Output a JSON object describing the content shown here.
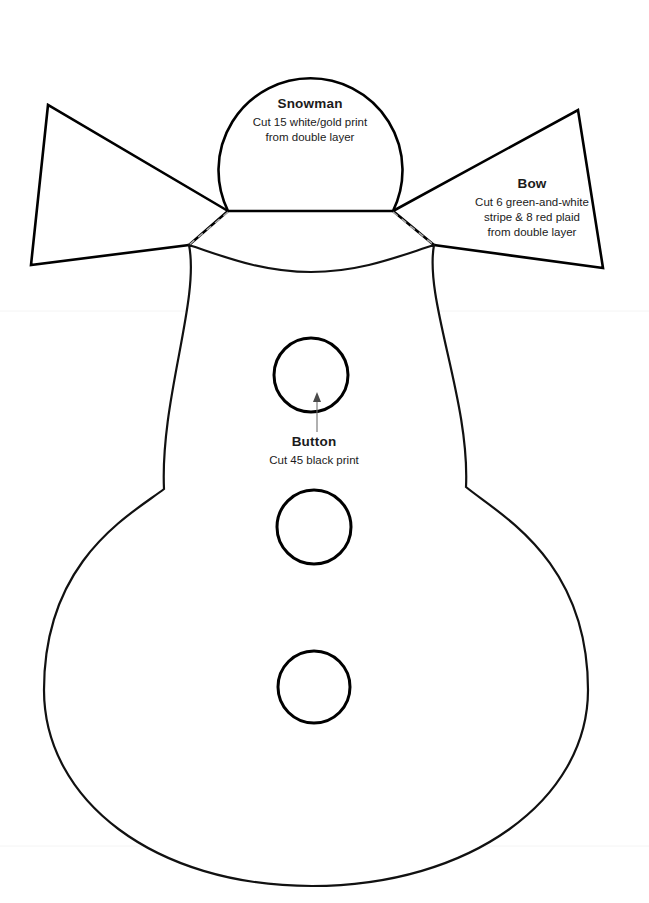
{
  "document": {
    "kind": "sewing-pattern-template",
    "background_color": "#ffffff",
    "line_color": "#000000",
    "fold_line_color": "#a8a8a8",
    "width": 649,
    "height": 903
  },
  "pieces": {
    "snowman": {
      "title": "Snowman",
      "instructions": [
        "Cut 15 white/gold print",
        "from double layer"
      ]
    },
    "bow": {
      "title": "Bow",
      "instructions": [
        "Cut 6 green-and-white",
        "stripe & 8 red plaid",
        "from double layer"
      ]
    },
    "button": {
      "title": "Button",
      "instructions": [
        "Cut 45 black print"
      ]
    }
  },
  "shapes": {
    "head_path": "M 228 211 A 92 92 0 1 1 393 211 Z",
    "body_path": "M 189 245 C 220 255 260 272 311 272 C 362 272 402 255 434 245 C 424 300 470 400 466 487 C 500 515 588 560 588 690 C 588 800 470 886 312 886 C 154 886 44 800 44 690 C 44 560 130 515 164 489 C 160 400 200 300 189 245 Z",
    "bow_left_path": "M 228 211 L 48 105 L 31 265 L 189 245 Z",
    "bow_right_path": "M 393 211 L 578 110 L 603 268 L 434 245 Z",
    "fold_left_path": "M 228 212 L 189 245",
    "fold_right_path": "M 393 212 L 434 245",
    "buttons": [
      {
        "cx": 311,
        "cy": 375,
        "r": 37
      },
      {
        "cx": 314,
        "cy": 527,
        "r": 37
      },
      {
        "cx": 314,
        "cy": 687,
        "r": 36
      }
    ],
    "button_leader": {
      "line": "M 317 432 L 317 398",
      "head": "317,392 313,402 321,402"
    },
    "scan_lines": [
      {
        "x1": 0,
        "y1": 311,
        "x2": 649,
        "y2": 311
      },
      {
        "x1": 0,
        "y1": 846,
        "x2": 649,
        "y2": 846
      }
    ]
  }
}
